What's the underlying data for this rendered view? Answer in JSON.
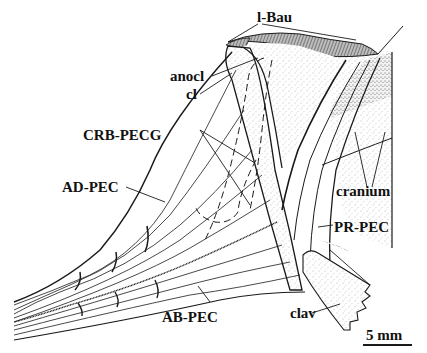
{
  "figure": {
    "type": "anatomical line drawing",
    "labels": {
      "l_bau": "l-Bau",
      "anocl": "anocl",
      "cl": "cl",
      "crb_pecg": "CRB-PECG",
      "ad_pec": "AD-PEC",
      "cranium": "cranium",
      "pr_pec": "PR-PEC",
      "ab_pec": "AB-PEC",
      "clav": "clav"
    },
    "scale_bar": {
      "label": "5 mm"
    },
    "colors": {
      "ink": "#1a1a1a",
      "stipple": "#8a8a8a",
      "background": "#ffffff"
    }
  }
}
